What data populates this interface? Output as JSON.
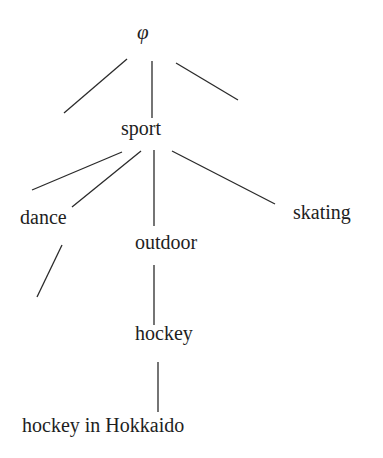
{
  "diagram": {
    "type": "tree",
    "nodes": [
      {
        "id": "root",
        "label": "φ",
        "x": 137,
        "y": 22
      },
      {
        "id": "sport",
        "label": "sport",
        "x": 121,
        "y": 118
      },
      {
        "id": "dance",
        "label": "dance",
        "x": 20,
        "y": 207
      },
      {
        "id": "outdoor",
        "label": "outdoor",
        "x": 135,
        "y": 232
      },
      {
        "id": "skating",
        "label": "skating",
        "x": 293,
        "y": 202
      },
      {
        "id": "hockey",
        "label": "hockey",
        "x": 135,
        "y": 323
      },
      {
        "id": "hockey_hokkaido",
        "label": "hockey in Hokkaido",
        "x": 22,
        "y": 415
      }
    ],
    "edges": [
      {
        "from": "root",
        "to": "unlabeled-left",
        "x1": 127,
        "y1": 59,
        "x2": 64,
        "y2": 113
      },
      {
        "from": "root",
        "to": "sport",
        "x1": 152,
        "y1": 61,
        "x2": 152,
        "y2": 118
      },
      {
        "from": "root",
        "to": "unlabeled-right",
        "x1": 176,
        "y1": 63,
        "x2": 238,
        "y2": 100
      },
      {
        "from": "sport",
        "to": "unlabeled-left",
        "x1": 122,
        "y1": 152,
        "x2": 32,
        "y2": 190
      },
      {
        "from": "sport",
        "to": "dance",
        "x1": 141,
        "y1": 151,
        "x2": 72,
        "y2": 207
      },
      {
        "from": "sport",
        "to": "outdoor",
        "x1": 154,
        "y1": 150,
        "x2": 154,
        "y2": 226
      },
      {
        "from": "sport",
        "to": "skating",
        "x1": 172,
        "y1": 151,
        "x2": 275,
        "y2": 204
      },
      {
        "from": "dance",
        "to": "unlabeled",
        "x1": 62,
        "y1": 245,
        "x2": 37,
        "y2": 297
      },
      {
        "from": "outdoor",
        "to": "hockey",
        "x1": 154,
        "y1": 265,
        "x2": 154,
        "y2": 325
      },
      {
        "from": "hockey",
        "to": "hockey_hokkaido",
        "x1": 158,
        "y1": 362,
        "x2": 158,
        "y2": 412
      }
    ],
    "stroke_color": "#2a2a2a",
    "background_color": "#ffffff"
  }
}
